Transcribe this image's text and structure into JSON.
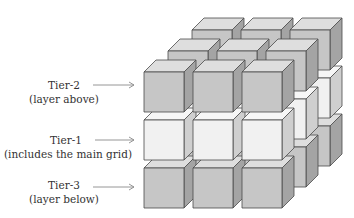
{
  "diagram": {
    "type": "3x3x3 stacked cube grid",
    "colors": {
      "gray": {
        "front": "#c6c6c6",
        "top": "#dedede",
        "side": "#a4a4a4"
      },
      "light": {
        "front": "#f1f1f1",
        "top": "#f6f6f6",
        "side": "#cfcfcf"
      },
      "stroke": "#4a4a4a",
      "arrow": "#8a8a8a"
    },
    "tiers": [
      {
        "id": "tier-2",
        "title": "Tier-2",
        "subtitle": "(layer above)",
        "level": 0,
        "shade": "gray"
      },
      {
        "id": "tier-1",
        "title": "Tier-1",
        "subtitle": "(includes the main grid)",
        "level": 1,
        "shade": "light"
      },
      {
        "id": "tier-3",
        "title": "Tier-3",
        "subtitle": "(layer below)",
        "level": 2,
        "shade": "gray"
      }
    ]
  },
  "labels": {
    "tier2": {
      "title": "Tier-2",
      "subtitle": "(layer above)"
    },
    "tier1": {
      "title": "Tier-1",
      "subtitle": "(includes the main grid)"
    },
    "tier3": {
      "title": "Tier-3",
      "subtitle": "(layer below)"
    }
  }
}
